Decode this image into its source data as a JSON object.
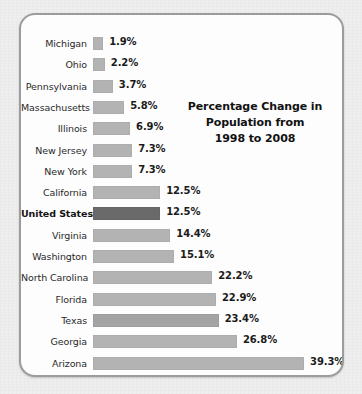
{
  "chart_data": {
    "type": "bar",
    "orientation": "horizontal",
    "title": "Percentage Change in Population from 1998 to 2008",
    "title_lines": [
      "Percentage Change in",
      "Population from",
      "1998 to 2008"
    ],
    "xlabel": "",
    "ylabel": "",
    "xlim": [
      0,
      39.3
    ],
    "grid": false,
    "legend": null,
    "value_suffix": "%",
    "categories": [
      "Michigan",
      "Ohio",
      "Pennsylvania",
      "Massachusetts",
      "Illinois",
      "New Jersey",
      "New York",
      "California",
      "United States",
      "Virginia",
      "Washington",
      "North Carolina",
      "Florida",
      "Texas",
      "Georgia",
      "Arizona"
    ],
    "values": [
      1.9,
      2.2,
      3.7,
      5.8,
      6.9,
      7.3,
      7.3,
      12.5,
      12.5,
      14.4,
      15.1,
      22.2,
      22.9,
      23.4,
      26.8,
      39.3
    ],
    "value_labels": [
      "1.9%",
      "2.2%",
      "3.7%",
      "5.8%",
      "6.9%",
      "7.3%",
      "7.3%",
      "12.5%",
      "12.5%",
      "14.4%",
      "15.1%",
      "22.2%",
      "22.9%",
      "23.4%",
      "26.8%",
      "39.3%"
    ],
    "highlight_category": "United States",
    "colors": {
      "bar": "#b3b3b3",
      "bar_highlight": "#6a6a6a",
      "bar_alt": "#a3a3a3",
      "text": "#1b1b1b",
      "frame_border": "#9b9c9e",
      "panel_background": "#fdfdfd",
      "page_background": "#edeeed"
    },
    "rows": [
      {
        "label": "Michigan",
        "value": 1.9,
        "value_label": "1.9%",
        "highlight": false,
        "shade": "normal"
      },
      {
        "label": "Ohio",
        "value": 2.2,
        "value_label": "2.2%",
        "highlight": false,
        "shade": "normal"
      },
      {
        "label": "Pennsylvania",
        "value": 3.7,
        "value_label": "3.7%",
        "highlight": false,
        "shade": "normal"
      },
      {
        "label": "Massachusetts",
        "value": 5.8,
        "value_label": "5.8%",
        "highlight": false,
        "shade": "normal"
      },
      {
        "label": "Illinois",
        "value": 6.9,
        "value_label": "6.9%",
        "highlight": false,
        "shade": "normal"
      },
      {
        "label": "New Jersey",
        "value": 7.3,
        "value_label": "7.3%",
        "highlight": false,
        "shade": "normal"
      },
      {
        "label": "New York",
        "value": 7.3,
        "value_label": "7.3%",
        "highlight": false,
        "shade": "normal"
      },
      {
        "label": "California",
        "value": 12.5,
        "value_label": "12.5%",
        "highlight": false,
        "shade": "normal"
      },
      {
        "label": "United States",
        "value": 12.5,
        "value_label": "12.5%",
        "highlight": true,
        "shade": "dark"
      },
      {
        "label": "Virginia",
        "value": 14.4,
        "value_label": "14.4%",
        "highlight": false,
        "shade": "normal"
      },
      {
        "label": "Washington",
        "value": 15.1,
        "value_label": "15.1%",
        "highlight": false,
        "shade": "normal"
      },
      {
        "label": "North Carolina",
        "value": 22.2,
        "value_label": "22.2%",
        "highlight": false,
        "shade": "normal"
      },
      {
        "label": "Florida",
        "value": 22.9,
        "value_label": "22.9%",
        "highlight": false,
        "shade": "normal"
      },
      {
        "label": "Texas",
        "value": 23.4,
        "value_label": "23.4%",
        "highlight": false,
        "shade": "alt"
      },
      {
        "label": "Georgia",
        "value": 26.8,
        "value_label": "26.8%",
        "highlight": false,
        "shade": "normal"
      },
      {
        "label": "Arizona",
        "value": 39.3,
        "value_label": "39.3%",
        "highlight": false,
        "shade": "normal"
      }
    ]
  }
}
